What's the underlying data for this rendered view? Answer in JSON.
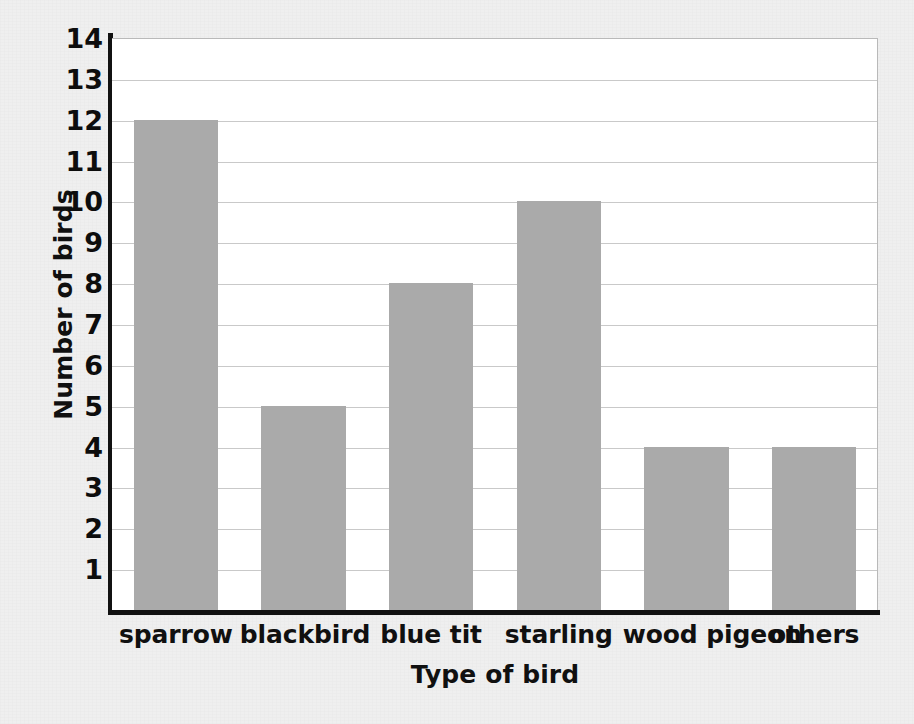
{
  "chart_data": {
    "type": "bar",
    "title": "",
    "xlabel": "Type of bird",
    "ylabel": "Number of birds",
    "categories": [
      "sparrow",
      "blackbird",
      "blue tit",
      "starling",
      "wood pigeon",
      "others"
    ],
    "values": [
      12,
      5,
      8,
      10,
      4,
      4
    ],
    "ylim": [
      0,
      14
    ],
    "yticks": [
      14,
      13,
      12,
      11,
      10,
      9,
      8,
      7,
      6,
      5,
      4,
      3,
      2,
      1
    ],
    "ytick_labels": [
      "14",
      "13",
      "12",
      "11",
      "10",
      "9",
      "8",
      "7",
      "6",
      "5",
      "4",
      "3",
      "2",
      "1"
    ],
    "grid": "horizontal",
    "legend": "none",
    "series": [
      {
        "name": "Number of birds",
        "values": [
          12,
          5,
          8,
          10,
          4,
          4
        ]
      }
    ],
    "colors": {
      "bar_fill": "#aaaaaa",
      "grid": "#c9c9c9",
      "axis": "#111111",
      "plot_background": "#ffffff",
      "figure_background": "#efefef",
      "text": "#101010"
    }
  }
}
